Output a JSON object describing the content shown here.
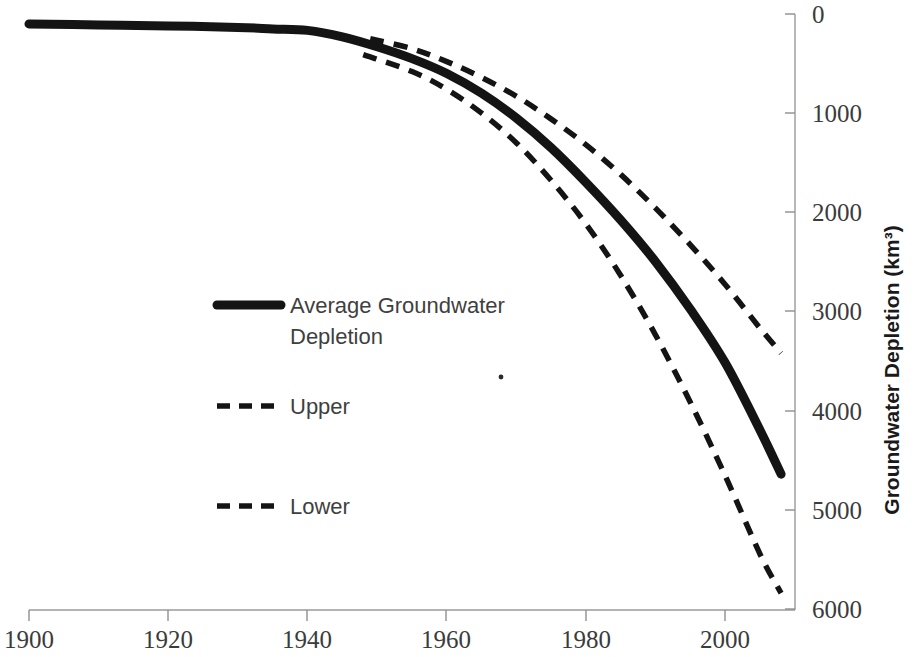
{
  "chart_data": {
    "type": "line",
    "title": "",
    "xlabel": "",
    "ylabel": "Groundwater Depletion (km³)",
    "xlim": [
      1900,
      2010
    ],
    "ylim": [
      0,
      6000
    ],
    "y_axis_position": "right",
    "y_axis_inverted": true,
    "grid": false,
    "legend_position": "center-left",
    "x_ticks": [
      1900,
      1920,
      1940,
      1960,
      1980,
      2000
    ],
    "x_tick_labels": [
      "1900",
      "1920",
      "1940",
      "1960",
      "1980",
      "2000"
    ],
    "y_ticks": [
      0,
      1000,
      2000,
      3000,
      4000,
      5000,
      6000
    ],
    "y_tick_labels": [
      "0",
      "1000",
      "2000",
      "3000",
      "4000",
      "5000",
      "6000"
    ],
    "series": [
      {
        "name": "Average Groundwater Depletion",
        "style": "solid",
        "color": "#141414",
        "x": [
          1900,
          1910,
          1920,
          1930,
          1935,
          1940,
          1945,
          1950,
          1955,
          1960,
          1965,
          1970,
          1975,
          1980,
          1985,
          1990,
          1995,
          2000,
          2005,
          2008
        ],
        "values": [
          100,
          110,
          120,
          135,
          150,
          165,
          230,
          330,
          450,
          600,
          800,
          1050,
          1350,
          1700,
          2080,
          2500,
          2980,
          3520,
          4200,
          4640
        ]
      },
      {
        "name": "Upper",
        "style": "dashed",
        "color": "#141414",
        "x": [
          1949,
          1955,
          1960,
          1965,
          1970,
          1975,
          1980,
          1985,
          1990,
          1995,
          2000,
          2005,
          2008
        ],
        "values": [
          250,
          350,
          480,
          640,
          830,
          1060,
          1320,
          1620,
          1960,
          2330,
          2730,
          3170,
          3420
        ]
      },
      {
        "name": "Lower",
        "style": "dashed",
        "color": "#141414",
        "x": [
          1948,
          1955,
          1960,
          1965,
          1970,
          1975,
          1980,
          1985,
          1990,
          1995,
          2000,
          2005,
          2008
        ],
        "values": [
          410,
          580,
          760,
          1000,
          1300,
          1680,
          2120,
          2640,
          3240,
          3920,
          4660,
          5450,
          5840
        ]
      }
    ]
  },
  "axis": {
    "y_title": "Groundwater Depletion (km³)",
    "y_tick_0": "0",
    "y_tick_1000": "1000",
    "y_tick_2000": "2000",
    "y_tick_3000": "3000",
    "y_tick_4000": "4000",
    "y_tick_5000": "5000",
    "y_tick_6000": "6000",
    "x_tick_1900": "1900",
    "x_tick_1920": "1920",
    "x_tick_1940": "1940",
    "x_tick_1960": "1960",
    "x_tick_1980": "1980",
    "x_tick_2000": "2000"
  },
  "legend": {
    "entries": [
      {
        "label_line1": "Average Groundwater",
        "label_line2": "Depletion",
        "style": "solid"
      },
      {
        "label_line1": "Upper",
        "label_line2": "",
        "style": "dashed"
      },
      {
        "label_line1": "Lower",
        "label_line2": "",
        "style": "dashed"
      }
    ]
  }
}
